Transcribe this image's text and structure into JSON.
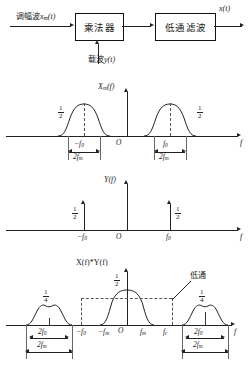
{
  "block_diagram": {
    "input_label_cn": "调幅波",
    "input_signal": "x",
    "input_signal_sub": "m",
    "input_signal_arg": "(t)",
    "multiplier_label": "乘法器",
    "lowpass_label": "低通滤波",
    "carrier_label_cn": "载波",
    "carrier_signal": "y",
    "carrier_signal_arg": "(t)",
    "output_signal": "x",
    "output_signal_arg": "(t)"
  },
  "plot1": {
    "title_main": "X",
    "title_sub": "m",
    "title_arg": "(f)",
    "axis_x": "f",
    "origin": "O",
    "amp_num": "1",
    "amp_den": "2",
    "center_left": "−f",
    "center_left_sub": "0",
    "center_right": "f",
    "center_right_sub": "0",
    "width_num": "2f",
    "width_sub": "m"
  },
  "plot2": {
    "title_main": "Y",
    "title_arg": "(f)",
    "axis_x": "f",
    "origin": "O",
    "amp_num": "1",
    "amp_den": "2",
    "tick_left": "−f",
    "tick_left_sub": "0",
    "tick_right": "f",
    "tick_right_sub": "0"
  },
  "plot3": {
    "title": "X(f)*Y(f)",
    "axis_x": "f",
    "origin": "O",
    "center_amp_num": "1",
    "center_amp_den": "2",
    "side_amp_num": "1",
    "side_amp_den": "4",
    "lowpass_callout": "低通",
    "tick_minus_f0": "−f",
    "tick_minus_f0_sub": "0",
    "tick_minus_fm": "−f",
    "tick_minus_fm_sub": "m",
    "tick_fm": "f",
    "tick_fm_sub": "m",
    "tick_fc": "f",
    "tick_fc_sub": "c",
    "dim_2f0": "2f",
    "dim_2f0_sub": "0",
    "dim_2fm": "2f",
    "dim_2fm_sub": "m"
  },
  "colors": {
    "ink": "#1a1a1a",
    "dash": "#555555",
    "background": "#ffffff"
  }
}
